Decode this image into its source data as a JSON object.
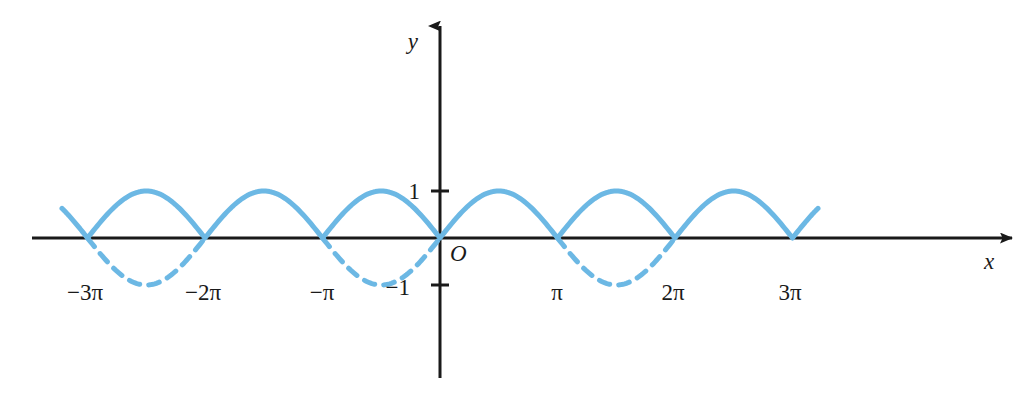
{
  "figure": {
    "kind": "math-graph",
    "background_color": "#ffffff",
    "axis_color": "#1a1a1a",
    "curve_color": "#6cb8e4",
    "origin_label": "O",
    "x_axis_label": "x",
    "y_axis_label": "y"
  },
  "chart_data": {
    "type": "line",
    "title": "",
    "subtitle": "",
    "xlabel": "x",
    "ylabel": "y",
    "grid": false,
    "legend": null,
    "xlim": [
      -3.4557519189487724,
      4.851019559851932
    ],
    "ylim": [
      -4.468085106382979,
      4.468085106382979
    ],
    "x_ticks": [
      -3,
      -2,
      -1,
      1,
      2,
      3
    ],
    "x_tick_labels": [
      "−3π",
      "−2π",
      "−π",
      "π",
      "2π",
      "3π"
    ],
    "y_ticks": [
      -1,
      1
    ],
    "y_tick_labels": [
      "−1",
      "1"
    ],
    "x_unit": "pi",
    "series": [
      {
        "name": "y = |sin x|",
        "style": "solid",
        "color": "#6cb8e4",
        "equation": "y = |sin(x)|",
        "x_domain_pi": [
          -3.2170212765957444,
          3.2170212765957444
        ],
        "samples_x_pi": [
          -3.2170212765957444,
          -3,
          -2.5,
          -2,
          -1.5,
          -1,
          -0.5,
          0,
          0.5,
          1,
          1.5,
          2,
          2.5,
          3,
          3.2170212765957444
        ],
        "samples_y": [
          0.6595744680851063,
          0,
          1,
          0,
          1,
          0,
          1,
          0,
          1,
          0,
          1,
          0,
          1,
          0,
          0.6595744680851063
        ]
      },
      {
        "name": "y = sin x (negative lobes)",
        "style": "dashed",
        "color": "#6cb8e4",
        "equation": "y = sin(x)",
        "dashed_intervals_pi": [
          [
            -3,
            -2
          ],
          [
            -1,
            0
          ],
          [
            1,
            2
          ]
        ],
        "samples_x_pi": [
          -3,
          -2.5,
          -2,
          -1,
          -0.5,
          0,
          1,
          1.5,
          2
        ],
        "samples_y": [
          0,
          -1,
          0,
          0,
          -1,
          0,
          0,
          -1,
          0
        ]
      }
    ],
    "annotations": [
      {
        "text": "O",
        "x_pi": 0,
        "y": 0,
        "role": "origin-label"
      },
      {
        "text": "x",
        "x_pi": 4.634,
        "y": -0.51,
        "role": "axis-name"
      },
      {
        "text": "y",
        "x_pi": -0.23,
        "y": 4.15,
        "role": "axis-name"
      }
    ]
  },
  "geometry": {
    "origin_px": {
      "x": 440,
      "y": 238
    },
    "pi_px": 117.5,
    "amplitude_px": 47,
    "x_axis_start_px": 32,
    "x_axis_end_px": 1012,
    "y_axis_top_px": 26,
    "y_axis_bottom_px": 378,
    "curve_start_px": 62,
    "curve_end_px": 818,
    "curve_width_px": 5,
    "axis_width_px": 3,
    "dash_pattern": "11 9"
  },
  "x_tick_labels": [
    {
      "id": "neg3pi",
      "text": "−3π",
      "x_px": 85,
      "y_px": 292
    },
    {
      "id": "neg2pi",
      "text": "−2π",
      "x_px": 203,
      "y_px": 292
    },
    {
      "id": "negpi",
      "text": "−π",
      "x_px": 322,
      "y_px": 292
    },
    {
      "id": "pi",
      "text": "π",
      "x_px": 557,
      "y_px": 292
    },
    {
      "id": "2pi",
      "text": "2π",
      "x_px": 673,
      "y_px": 292
    },
    {
      "id": "3pi",
      "text": "3π",
      "x_px": 790,
      "y_px": 292
    }
  ],
  "y_tick_labels": [
    {
      "id": "one",
      "text": "1",
      "x_px": 420,
      "y_px": 191
    },
    {
      "id": "negone",
      "text": "−1",
      "x_px": 410,
      "y_px": 287
    }
  ]
}
